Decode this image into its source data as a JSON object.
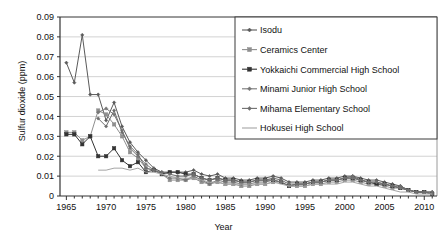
{
  "chart_data": {
    "type": "line",
    "title": "",
    "xlabel": "Year",
    "ylabel": "Sulfur dioxide (ppm)",
    "xlim": [
      1964.2,
      2011.6
    ],
    "ylim": [
      0,
      0.09
    ],
    "grid": "horizontal",
    "legend_position": "top-right",
    "xticks": [
      1965,
      1970,
      1975,
      1980,
      1985,
      1990,
      1995,
      2000,
      2005,
      2010
    ],
    "xtick_labels": [
      "1965",
      "1970",
      "1975",
      "1980",
      "1985",
      "1990",
      "1995",
      "2000",
      "2005",
      "2010"
    ],
    "minor_xtick_step": 1,
    "yticks": [
      0,
      0.01,
      0.02,
      0.03,
      0.04,
      0.05,
      0.06,
      0.07,
      0.08,
      0.09
    ],
    "ytick_labels": [
      "0",
      "0.01",
      "0.02",
      "0.03",
      "0.04",
      "0.05",
      "0.06",
      "0.07",
      "0.08",
      "0.09"
    ],
    "series": [
      {
        "name": "Isodu",
        "color": "#5a5a5a",
        "marker": "diamond",
        "x": [
          1965,
          1966,
          1967,
          1968,
          1969,
          1970,
          1971,
          1972,
          1973,
          1974,
          1975,
          1976,
          1977,
          1978,
          1979,
          1980,
          1981,
          1982,
          1983,
          1984,
          1985,
          1986,
          1987,
          1988,
          1989,
          1990,
          1991,
          1992,
          1993,
          1994,
          1995,
          1996,
          1997,
          1998,
          1999,
          2000,
          2001,
          2002,
          2003,
          2004,
          2005,
          2006,
          2007,
          2008,
          2009,
          2010,
          2011
        ],
        "y": [
          0.067,
          0.057,
          0.081,
          0.051,
          0.051,
          0.038,
          0.047,
          0.035,
          0.027,
          0.022,
          0.018,
          0.014,
          0.012,
          0.012,
          0.012,
          0.012,
          0.013,
          0.011,
          0.01,
          0.011,
          0.009,
          0.009,
          0.008,
          0.008,
          0.009,
          0.009,
          0.01,
          0.009,
          0.007,
          0.007,
          0.007,
          0.008,
          0.008,
          0.009,
          0.009,
          0.01,
          0.01,
          0.009,
          0.008,
          0.008,
          0.007,
          0.006,
          0.005,
          0.003,
          0.002,
          0.002,
          0.002
        ]
      },
      {
        "name": "Ceramics Center",
        "color": "#8f8f8f",
        "marker": "square",
        "x": [
          1965,
          1966,
          1967,
          1968,
          1969,
          1970,
          1971,
          1972,
          1973,
          1974,
          1975,
          1976,
          1977,
          1978,
          1979,
          1980,
          1981,
          1982,
          1983,
          1984,
          1985,
          1986,
          1987,
          1988,
          1989,
          1990,
          1991,
          1992,
          1993,
          1994,
          1995,
          1996,
          1997,
          1998,
          1999,
          2000,
          2001,
          2002,
          2003,
          2004,
          2005,
          2006,
          2007,
          2008,
          2009,
          2010,
          2011
        ],
        "y": [
          0.032,
          0.032,
          0.028,
          0.03,
          0.043,
          0.041,
          0.036,
          0.03,
          0.022,
          0.019,
          0.014,
          0.013,
          0.011,
          0.008,
          0.008,
          0.008,
          0.009,
          0.007,
          0.006,
          0.007,
          0.006,
          0.006,
          0.005,
          0.005,
          0.006,
          0.006,
          0.007,
          0.007,
          0.005,
          0.005,
          0.005,
          0.006,
          0.006,
          0.007,
          0.007,
          0.008,
          0.008,
          0.007,
          0.006,
          0.006,
          0.005,
          0.004,
          0.004,
          0.003,
          0.002,
          0.002,
          0.001
        ]
      },
      {
        "name": "Yokkaichi Commercial High School",
        "color": "#333333",
        "marker": "square",
        "x": [
          1965,
          1966,
          1967,
          1968,
          1969,
          1970,
          1971,
          1972,
          1973,
          1974,
          1975,
          1976,
          1977,
          1978,
          1979,
          1980,
          1981,
          1982,
          1983,
          1984,
          1985,
          1986,
          1987,
          1988,
          1989,
          1990,
          1991,
          1992,
          1993,
          1994,
          1995,
          1996,
          1997,
          1998,
          1999,
          2000,
          2001,
          2002,
          2003,
          2004,
          2005,
          2006,
          2007,
          2008,
          2009,
          2010,
          2011
        ],
        "y": [
          0.031,
          0.031,
          0.026,
          0.03,
          0.02,
          0.02,
          0.024,
          0.018,
          0.015,
          0.017,
          0.012,
          0.013,
          0.011,
          0.012,
          0.012,
          0.011,
          0.011,
          0.009,
          0.008,
          0.009,
          0.008,
          0.008,
          0.007,
          0.007,
          0.008,
          0.008,
          0.008,
          0.007,
          0.005,
          0.006,
          0.006,
          0.007,
          0.007,
          0.008,
          0.008,
          0.009,
          0.009,
          0.008,
          0.007,
          0.006,
          0.006,
          0.005,
          0.004,
          0.003,
          0.002,
          0.002,
          0.001
        ]
      },
      {
        "name": "Minami Junior High School",
        "color": "#777777",
        "marker": "diamond",
        "x": [
          1969,
          1970,
          1971,
          1972,
          1973,
          1974,
          1975,
          1976,
          1977,
          1978,
          1979,
          1980,
          1981,
          1982,
          1983,
          1984,
          1985,
          1986,
          1987,
          1988,
          1989,
          1990,
          1991,
          1992,
          1993,
          1994,
          1995,
          1996,
          1997,
          1998,
          1999,
          2000,
          2001,
          2002,
          2003,
          2004,
          2005,
          2006,
          2007,
          2008,
          2009,
          2010,
          2011
        ],
        "y": [
          0.042,
          0.044,
          0.041,
          0.033,
          0.024,
          0.02,
          0.016,
          0.013,
          0.011,
          0.009,
          0.009,
          0.008,
          0.01,
          0.008,
          0.006,
          0.008,
          0.007,
          0.007,
          0.006,
          0.006,
          0.007,
          0.007,
          0.008,
          0.007,
          0.005,
          0.006,
          0.006,
          0.007,
          0.007,
          0.008,
          0.008,
          0.009,
          0.009,
          0.008,
          0.007,
          0.007,
          0.006,
          0.005,
          0.004,
          0.003,
          0.002,
          0.002,
          0.001
        ]
      },
      {
        "name": "Mihama Elementary School",
        "color": "#6e6e6e",
        "marker": "diamond",
        "x": [
          1969,
          1970,
          1971,
          1972,
          1973,
          1974,
          1975,
          1976,
          1977,
          1978,
          1979,
          1980,
          1981,
          1982,
          1983,
          1984,
          1985,
          1986,
          1987,
          1988,
          1989,
          1990,
          1991,
          1992,
          1993,
          1994,
          1995,
          1996,
          1997,
          1998,
          1999,
          2000,
          2001,
          2002,
          2003,
          2004,
          2005,
          2006,
          2007,
          2008,
          2009,
          2010,
          2011
        ],
        "y": [
          0.039,
          0.035,
          0.043,
          0.032,
          0.025,
          0.021,
          0.014,
          0.013,
          0.012,
          0.011,
          0.01,
          0.01,
          0.011,
          0.009,
          0.008,
          0.009,
          0.008,
          0.008,
          0.007,
          0.007,
          0.008,
          0.008,
          0.009,
          0.008,
          0.006,
          0.006,
          0.006,
          0.007,
          0.007,
          0.008,
          0.008,
          0.009,
          0.01,
          0.008,
          0.007,
          0.007,
          0.006,
          0.005,
          0.005,
          0.003,
          0.002,
          0.002,
          0.002
        ]
      },
      {
        "name": "Hokusei High School",
        "color": "#a5a5a5",
        "marker": "none",
        "x": [
          1969,
          1970,
          1971,
          1972,
          1973,
          1974,
          1975,
          1976,
          1977,
          1978,
          1979,
          1980,
          1981,
          1982,
          1983,
          1984,
          1985,
          1986,
          1987,
          1988,
          1989,
          1990,
          1991,
          1992,
          1993,
          1994,
          1995,
          1996,
          1997,
          1998,
          1999,
          2000,
          2001,
          2002,
          2003,
          2004,
          2005,
          2006,
          2007,
          2008,
          2009,
          2010,
          2011
        ],
        "y": [
          0.013,
          0.013,
          0.014,
          0.014,
          0.013,
          0.014,
          0.012,
          0.012,
          0.011,
          0.01,
          0.009,
          0.009,
          0.009,
          0.008,
          0.007,
          0.007,
          0.006,
          0.006,
          0.006,
          0.006,
          0.006,
          0.006,
          0.007,
          0.006,
          0.005,
          0.005,
          0.005,
          0.006,
          0.006,
          0.006,
          0.006,
          0.007,
          0.007,
          0.006,
          0.005,
          0.005,
          0.004,
          0.003,
          0.002,
          0.002,
          0.001,
          0.001,
          0.001
        ]
      }
    ]
  }
}
